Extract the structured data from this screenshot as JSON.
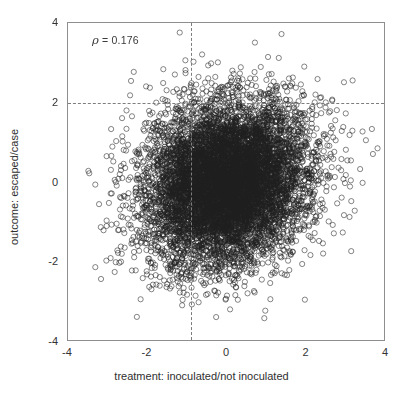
{
  "chart_data": {
    "type": "scatter",
    "title": "",
    "xlabel": "treatment: inoculated/not inoculated",
    "ylabel": "outcome: escaped/case",
    "xlim": [
      -4,
      4
    ],
    "ylim": [
      -4,
      4
    ],
    "xticks": [
      -4,
      -2,
      0,
      2,
      4
    ],
    "yticks": [
      -4,
      -2,
      0,
      2,
      4
    ],
    "xticklabels": [
      "-4",
      "-2",
      "0",
      "2",
      "4"
    ],
    "yticklabels": [
      "-4",
      "-2",
      "0",
      "2",
      "4"
    ],
    "grid": false,
    "legend": null,
    "annotations": [
      {
        "name": "correlation",
        "symbol": "ρ",
        "equals": " = ",
        "value": "0.176",
        "text": "ρ = 0.176",
        "x": -3.4,
        "y": 3.55
      }
    ],
    "reference_lines": [
      {
        "orientation": "horizontal",
        "value": 2.0,
        "style": "dashed",
        "color": "#7d7d7d"
      },
      {
        "orientation": "vertical",
        "value": -0.9,
        "style": "dashed",
        "color": "#7d7d7d"
      }
    ],
    "series": [
      {
        "name": "observations",
        "marker": "open-circle",
        "marker_size": 2.6,
        "color": "#2a2a2a",
        "n_points": 9000,
        "correlation": 0.176,
        "mean_x": 0.0,
        "mean_y": 0.0,
        "sd_x": 1.0,
        "sd_y": 1.0,
        "x_range": [
          -3.85,
          3.65
        ],
        "y_range": [
          -3.85,
          3.55
        ],
        "description": "Dense bivariate-normal cloud centred near the origin with weak positive correlation; heavy overplotting produces a near-solid dark core."
      }
    ],
    "axis_color": "#8e8e8e",
    "tick_color": "#5d5d5d",
    "background": "#ffffff"
  }
}
